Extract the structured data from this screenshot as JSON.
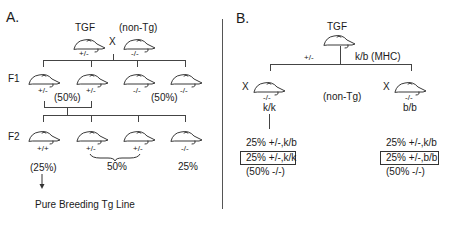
{
  "panel_a": {
    "label": "A.",
    "parents": {
      "left": {
        "label": "TGF",
        "genotype": "+/-"
      },
      "cross_symbol": "X",
      "right": {
        "label": "(non-Tg)",
        "genotype": "-/-"
      }
    },
    "f1": {
      "row_label": "F1",
      "mice": [
        {
          "genotype": "+/-"
        },
        {
          "genotype": "+/-"
        },
        {
          "genotype": "-/-"
        },
        {
          "genotype": "-/-"
        }
      ],
      "percent_left": "(50%)",
      "percent_right": "(50%)"
    },
    "f2": {
      "row_label": "F2",
      "mice": [
        {
          "genotype": "+/+"
        },
        {
          "genotype": "+/-"
        },
        {
          "genotype": "+/-"
        },
        {
          "genotype": "-/-"
        }
      ],
      "percent_homozygous": "(25%)",
      "percent_heterozygous": "50%",
      "percent_null": "25%"
    },
    "outcome": "Pure Breeding Tg Line"
  },
  "panel_b": {
    "label": "B.",
    "parent": {
      "label": "TGF",
      "genotype": "+/-",
      "mhc": "k/b (MHC)"
    },
    "cross_label": "(non-Tg)",
    "left_cross": {
      "cross_symbol": "X",
      "genotype": "-/-",
      "mhc": "k/k",
      "outcomes": [
        "25% +/-,k/b",
        "25% +/-,k/k",
        "(50% -/-)"
      ]
    },
    "right_cross": {
      "cross_symbol": "X",
      "genotype": "-/-",
      "mhc": "b/b",
      "outcomes": [
        "25% +/-,k/b",
        "25% +/-,b/b",
        "(50% -/-)"
      ]
    }
  }
}
